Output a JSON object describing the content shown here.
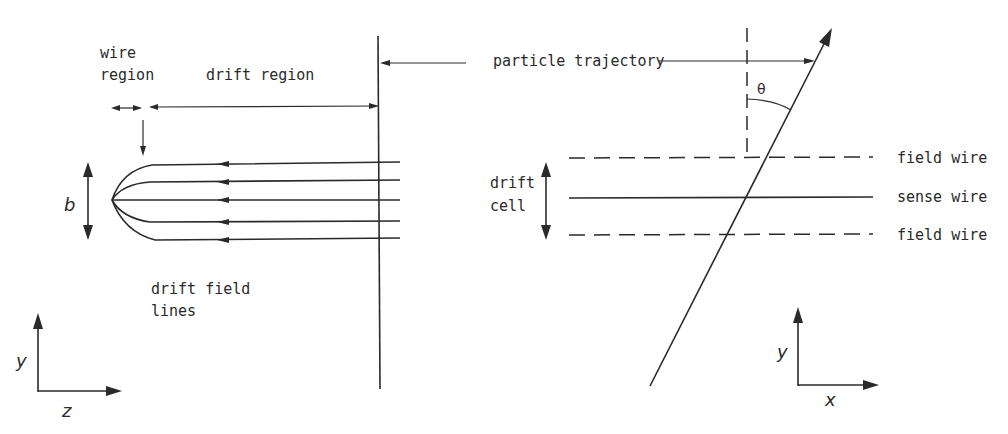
{
  "left_panel": {
    "labels": {
      "wire_region_line1": "wire",
      "wire_region_line2": "region",
      "drift_region": "drift region",
      "b": "b",
      "drift_field_lines_line1": "drift field",
      "drift_field_lines_line2": "lines"
    },
    "axes": {
      "vertical": "y",
      "horizontal": "z"
    },
    "field_lines_count": 5
  },
  "center": {
    "particle_trajectory": "particle trajectory"
  },
  "right_panel": {
    "labels": {
      "theta": "θ",
      "drift_cell_line1": "drift",
      "drift_cell_line2": "cell",
      "field_wire_top": "field wire",
      "sense_wire": "sense wire",
      "field_wire_bottom": "field wire"
    },
    "axes": {
      "vertical": "y",
      "horizontal": "x"
    }
  },
  "colors": {
    "ink": "#2a2a2a",
    "background": "#ffffff"
  }
}
